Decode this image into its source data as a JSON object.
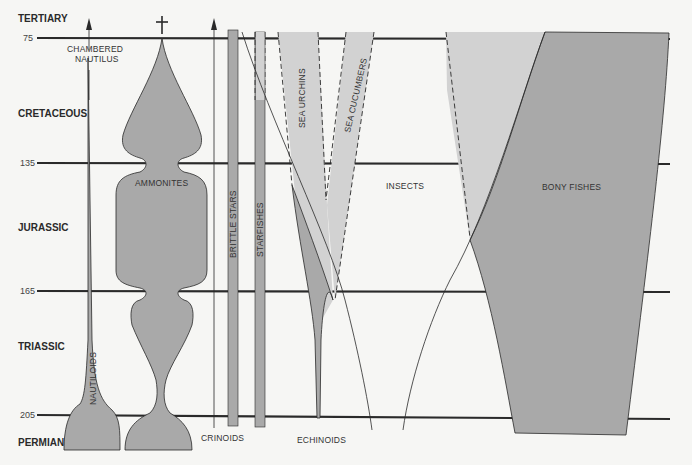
{
  "diagram": {
    "periods": [
      {
        "name": "TERTIARY",
        "y": 19
      },
      {
        "name": "CRETACEOUS",
        "y": 113
      },
      {
        "name": "JURASSIC",
        "y": 227
      },
      {
        "name": "TRIASSIC",
        "y": 348
      },
      {
        "name": "PERMIAN",
        "y": 444
      }
    ],
    "time_ticks": [
      {
        "label": "75",
        "y": 38
      },
      {
        "label": "135",
        "y": 163
      },
      {
        "label": "165",
        "y": 291
      },
      {
        "label": "205",
        "y": 415
      }
    ],
    "groups": [
      {
        "name": "CHAMBERED NAUTILUS",
        "line1": "CHAMBERED",
        "line2": "NAUTILUS"
      },
      {
        "name": "NAUTILOIDS"
      },
      {
        "name": "AMMONITES"
      },
      {
        "name": "CRINOIDS"
      },
      {
        "name": "BRITTLE STARS"
      },
      {
        "name": "STARFISHES"
      },
      {
        "name": "SEA URCHINS"
      },
      {
        "name": "SEA CUCUMBERS"
      },
      {
        "name": "ECHINOIDS"
      },
      {
        "name": "INSECTS"
      },
      {
        "name": "BONY FISHES"
      }
    ],
    "colors": {
      "dark_fill": "#a9a9a9",
      "light_fill": "#d2d2d2",
      "line": "#2a2a2a",
      "background": "#f6f6f4"
    }
  }
}
